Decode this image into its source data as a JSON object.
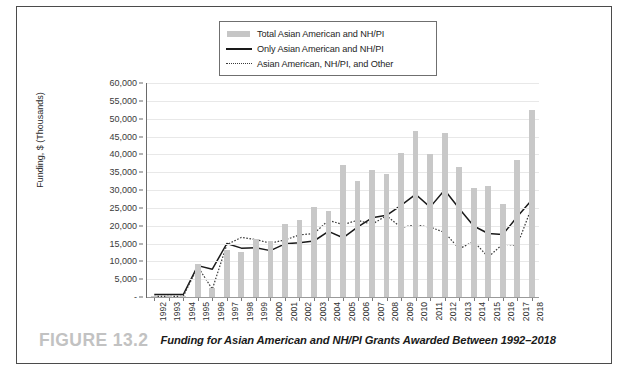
{
  "figure": {
    "number_label": "FIGURE 13.2",
    "caption": "Funding for Asian American and NH/PI Grants Awarded Between 1992–2018"
  },
  "legend": {
    "position": "top-center",
    "items": [
      {
        "label": "Total Asian American and NH/PI",
        "marker": "bar-swatch",
        "color": "#c8c8c8"
      },
      {
        "label": "Only Asian American and NH/PI",
        "marker": "solid-line",
        "color": "#1a1a1a"
      },
      {
        "label": "Asian American, NH/PI, and Other",
        "marker": "dotted-line",
        "color": "#3a3a3a"
      }
    ]
  },
  "chart_data": {
    "type": "bar",
    "title": "",
    "xlabel": "",
    "ylabel": "Funding, $ (Thousands)",
    "ylim": [
      0,
      60000
    ],
    "ytick_values": [
      0,
      5000,
      10000,
      15000,
      20000,
      25000,
      30000,
      35000,
      40000,
      45000,
      50000,
      55000,
      60000
    ],
    "ytick_labels": [
      "-",
      "5,000",
      "10,000",
      "15,000",
      "20,000",
      "25,000",
      "30,000",
      "35,000",
      "40,000",
      "45,000",
      "50,000",
      "55,000",
      "60,000"
    ],
    "grid": true,
    "categories": [
      "1992",
      "1993",
      "1994",
      "1995",
      "1996",
      "1997",
      "1998",
      "1999",
      "2000",
      "2001",
      "2002",
      "2003",
      "2004",
      "2005",
      "2006",
      "2007",
      "2008",
      "2009",
      "2010",
      "2011",
      "2012",
      "2013",
      "2014",
      "2015",
      "2016",
      "2017",
      "2018"
    ],
    "series": [
      {
        "name": "Total Asian American and NH/PI",
        "type": "bar",
        "color": "#c8c8c8",
        "values": [
          400,
          400,
          400,
          9300,
          2600,
          13200,
          12700,
          16300,
          15600,
          20500,
          21500,
          25200,
          24000,
          37000,
          32500,
          35500,
          34500,
          40500,
          46500,
          40000,
          46000,
          36500,
          30600,
          31000,
          26000,
          38500,
          52500
        ]
      },
      {
        "name": "Only Asian American and NH/PI",
        "type": "line",
        "style": "solid",
        "color": "#1a1a1a",
        "values": [
          700,
          700,
          700,
          8800,
          7800,
          15000,
          13700,
          13800,
          13000,
          14900,
          15200,
          15700,
          18400,
          16600,
          19600,
          22200,
          22900,
          25700,
          28800,
          25200,
          30000,
          24800,
          19900,
          17800,
          17500,
          22500,
          27200
        ]
      },
      {
        "name": "Asian American, NH/PI, and Other",
        "type": "line",
        "style": "dotted",
        "color": "#3a3a3a",
        "values": [
          200,
          200,
          200,
          8500,
          2200,
          14700,
          16700,
          16100,
          15100,
          16000,
          17400,
          17800,
          21500,
          20300,
          21500,
          20400,
          22800,
          19500,
          20200,
          19600,
          18100,
          13500,
          15600,
          11200,
          14800,
          14500,
          25200
        ]
      }
    ]
  }
}
